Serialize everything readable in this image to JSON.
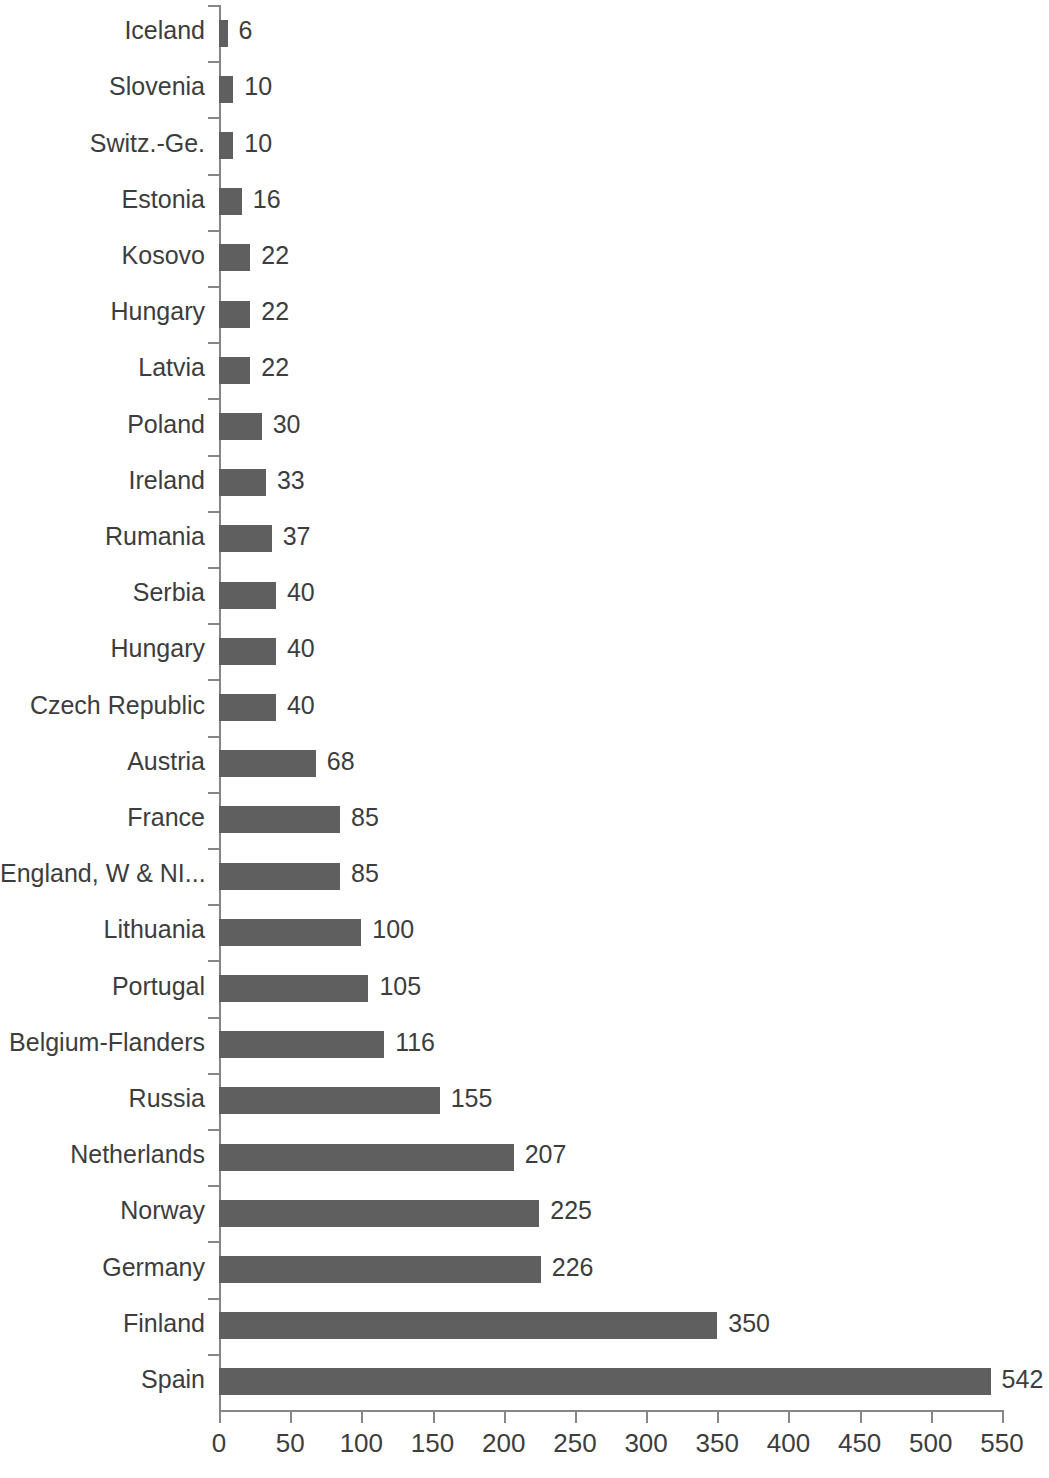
{
  "chart_data": {
    "type": "bar",
    "orientation": "horizontal",
    "title": "",
    "subtitle": "",
    "xlabel": "",
    "ylabel": "",
    "xlim": [
      0,
      550
    ],
    "xticks": [
      0,
      50,
      100,
      150,
      200,
      250,
      300,
      350,
      400,
      450,
      500,
      550
    ],
    "xtick_labels": [
      "0",
      "50",
      "100",
      "150",
      "200",
      "250",
      "300",
      "350",
      "400",
      "450",
      "500",
      "550"
    ],
    "grid": false,
    "legend": null,
    "show_data_labels": true,
    "bar_color": "#5f5f5f",
    "axis_color": "#868686",
    "text_color": "#3d3d3d",
    "categories": [
      "Iceland",
      "Slovenia",
      "Switz.-Ge.",
      "Estonia",
      "Kosovo",
      "Hungary",
      "Latvia",
      "Poland",
      "Ireland",
      "Rumania",
      "Serbia",
      "Hungary",
      "Czech Republic",
      "Austria",
      "France",
      "England, W & NI...",
      "Lithuania",
      "Portugal",
      "Belgium-Flanders",
      "Russia",
      "Netherlands",
      "Norway",
      "Germany",
      "Finland",
      "Spain"
    ],
    "values": [
      6,
      10,
      10,
      16,
      22,
      22,
      22,
      30,
      33,
      37,
      40,
      40,
      40,
      68,
      85,
      85,
      100,
      105,
      116,
      155,
      207,
      225,
      226,
      350,
      542
    ],
    "value_labels": [
      "6",
      "10",
      "10",
      "16",
      "22",
      "22",
      "22",
      "30",
      "33",
      "37",
      "40",
      "40",
      "40",
      "68",
      "85",
      "85",
      "100",
      "105",
      "116",
      "155",
      "207",
      "225",
      "226",
      "350",
      "542"
    ]
  }
}
